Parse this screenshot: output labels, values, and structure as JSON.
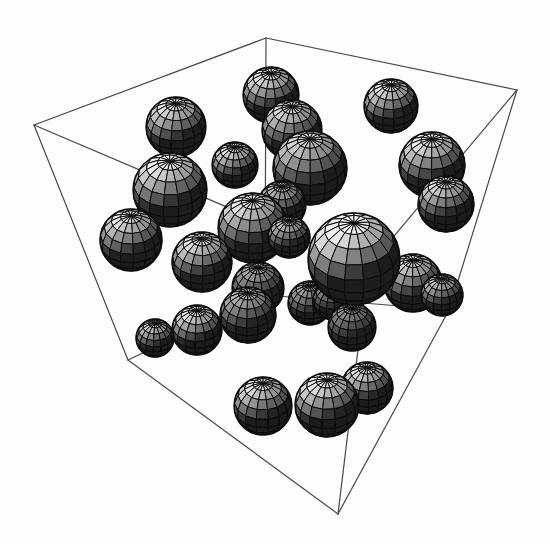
{
  "figure": {
    "background": "#fdfdfd",
    "edge_color": "#474747",
    "edge_width": 1.2,
    "mesh_stroke": "#0c0c0c",
    "mesh_stroke_width": 1.0,
    "rim_color": "#0a0a0a",
    "rim_width": 1.3,
    "base_fill": "#161616",
    "canvas": {
      "width": 550,
      "height": 544
    },
    "tilt_deg": 38,
    "meridians": 15,
    "parallels": 9,
    "light": [
      -0.35,
      0.82,
      0.45
    ],
    "shade_base": 26,
    "shade_range": 215
  },
  "chart_data": {
    "type": "scatter",
    "projection": "3d-spheres-in-wireframe-box",
    "title": "",
    "xlabel": "",
    "ylabel": "",
    "grid": false,
    "legend": false,
    "box_vertices": {
      "A": [
        34,
        125
      ],
      "B": [
        266,
        38
      ],
      "C": [
        517,
        90
      ],
      "D": [
        449,
        310
      ],
      "E": [
        338,
        514
      ],
      "F": [
        128,
        360
      ],
      "G": [
        368,
        267
      ],
      "H": [
        265,
        295
      ]
    },
    "box_edges": [
      [
        "A",
        "B"
      ],
      [
        "B",
        "C"
      ],
      [
        "C",
        "D"
      ],
      [
        "D",
        "E"
      ],
      [
        "E",
        "F"
      ],
      [
        "F",
        "A"
      ],
      [
        "B",
        "H"
      ],
      [
        "D",
        "H"
      ],
      [
        "F",
        "H"
      ],
      [
        "A",
        "G"
      ],
      [
        "C",
        "G"
      ],
      [
        "G",
        "E"
      ]
    ],
    "spheres": [
      {
        "cx": 271,
        "cy": 95,
        "r": 28,
        "shade": 1.0
      },
      {
        "cx": 391,
        "cy": 106,
        "r": 27,
        "shade": 1.0
      },
      {
        "cx": 176,
        "cy": 127,
        "r": 30,
        "shade": 1.0
      },
      {
        "cx": 292,
        "cy": 130,
        "r": 30,
        "shade": 0.95
      },
      {
        "cx": 432,
        "cy": 165,
        "r": 33,
        "shade": 1.0
      },
      {
        "cx": 235,
        "cy": 165,
        "r": 23,
        "shade": 1.0
      },
      {
        "cx": 310,
        "cy": 168,
        "r": 37,
        "shade": 0.9
      },
      {
        "cx": 170,
        "cy": 190,
        "r": 37,
        "shade": 1.05
      },
      {
        "cx": 446,
        "cy": 204,
        "r": 28,
        "shade": 0.95
      },
      {
        "cx": 282,
        "cy": 205,
        "r": 24,
        "shade": 0.8
      },
      {
        "cx": 253,
        "cy": 228,
        "r": 35,
        "shade": 1.0
      },
      {
        "cx": 289,
        "cy": 237,
        "r": 21,
        "shade": 0.85
      },
      {
        "cx": 131,
        "cy": 240,
        "r": 31,
        "shade": 1.0
      },
      {
        "cx": 202,
        "cy": 262,
        "r": 30,
        "shade": 1.0
      },
      {
        "cx": 258,
        "cy": 288,
        "r": 26,
        "shade": 0.7
      },
      {
        "cx": 413,
        "cy": 283,
        "r": 29,
        "shade": 0.95
      },
      {
        "cx": 442,
        "cy": 295,
        "r": 21,
        "shade": 0.85
      },
      {
        "cx": 310,
        "cy": 303,
        "r": 22,
        "shade": 0.7
      },
      {
        "cx": 333,
        "cy": 300,
        "r": 20,
        "shade": 0.6
      },
      {
        "cx": 352,
        "cy": 327,
        "r": 24,
        "shade": 0.6
      },
      {
        "cx": 354,
        "cy": 259,
        "r": 46,
        "shade": 1.12
      },
      {
        "cx": 248,
        "cy": 315,
        "r": 28,
        "shade": 0.75
      },
      {
        "cx": 197,
        "cy": 330,
        "r": 25,
        "shade": 1.0
      },
      {
        "cx": 155,
        "cy": 338,
        "r": 19,
        "shade": 0.95
      },
      {
        "cx": 367,
        "cy": 388,
        "r": 26,
        "shade": 1.0
      },
      {
        "cx": 263,
        "cy": 406,
        "r": 29,
        "shade": 1.0
      },
      {
        "cx": 327,
        "cy": 405,
        "r": 32,
        "shade": 1.05
      }
    ]
  }
}
